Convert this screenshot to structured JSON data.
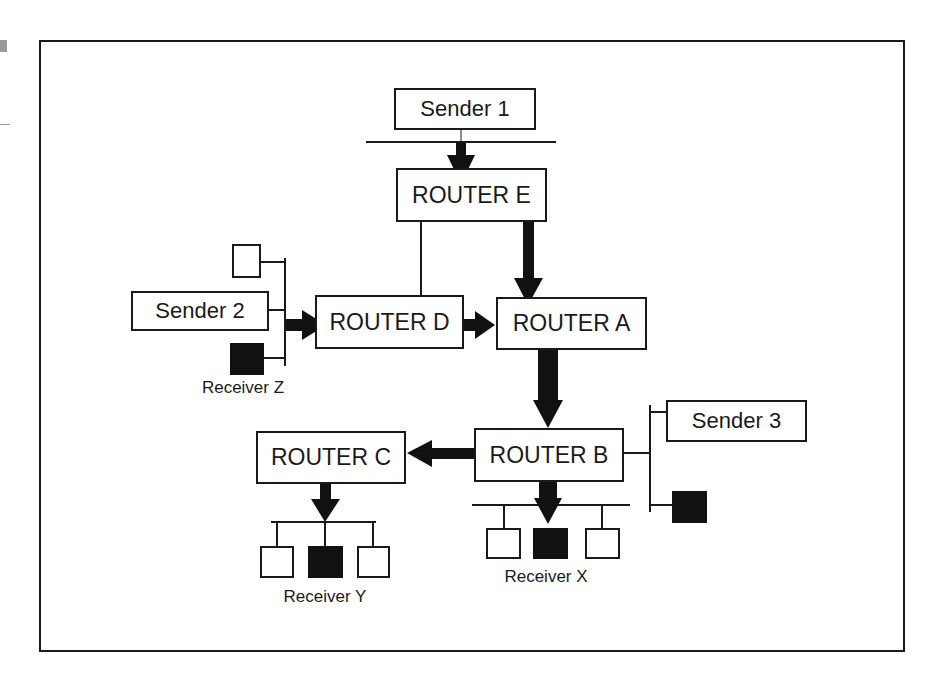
{
  "diagram": {
    "type": "multicast-routing-network",
    "colors": {
      "line": "#1a1a1a",
      "member_host": "#111111",
      "host": "#ffffff",
      "background": "#ffffff"
    },
    "senders": [
      {
        "id": "sender1",
        "label": "Sender 1"
      },
      {
        "id": "sender2",
        "label": "Sender 2"
      },
      {
        "id": "sender3",
        "label": "Sender 3"
      }
    ],
    "routers": [
      {
        "id": "routerE",
        "label": "ROUTER E"
      },
      {
        "id": "routerD",
        "label": "ROUTER D"
      },
      {
        "id": "routerA",
        "label": "ROUTER A"
      },
      {
        "id": "routerB",
        "label": "ROUTER B"
      },
      {
        "id": "routerC",
        "label": "ROUTER C"
      }
    ],
    "receivers": [
      {
        "id": "receiverZ",
        "label": "Receiver Z"
      },
      {
        "id": "receiverX",
        "label": "Receiver X"
      },
      {
        "id": "receiverY",
        "label": "Receiver Y"
      }
    ],
    "links": [
      {
        "from": "Sender 1 LAN",
        "to": "ROUTER E",
        "style": "thick-arrow"
      },
      {
        "from": "ROUTER E",
        "to": "ROUTER D",
        "style": "thin-line"
      },
      {
        "from": "ROUTER E",
        "to": "ROUTER A",
        "style": "thick-arrow"
      },
      {
        "from": "Sender 2 LAN",
        "to": "ROUTER D",
        "style": "thick-arrow"
      },
      {
        "from": "ROUTER D",
        "to": "ROUTER A",
        "style": "thick-arrow"
      },
      {
        "from": "ROUTER A",
        "to": "ROUTER B",
        "style": "thick-arrow"
      },
      {
        "from": "ROUTER B",
        "to": "ROUTER C",
        "style": "thick-arrow"
      },
      {
        "from": "ROUTER B",
        "to": "Receiver X LAN",
        "style": "thick-arrow"
      },
      {
        "from": "ROUTER B",
        "to": "Sender 3 LAN",
        "style": "thin-line"
      },
      {
        "from": "ROUTER C",
        "to": "Receiver Y LAN",
        "style": "thick-arrow"
      }
    ]
  }
}
